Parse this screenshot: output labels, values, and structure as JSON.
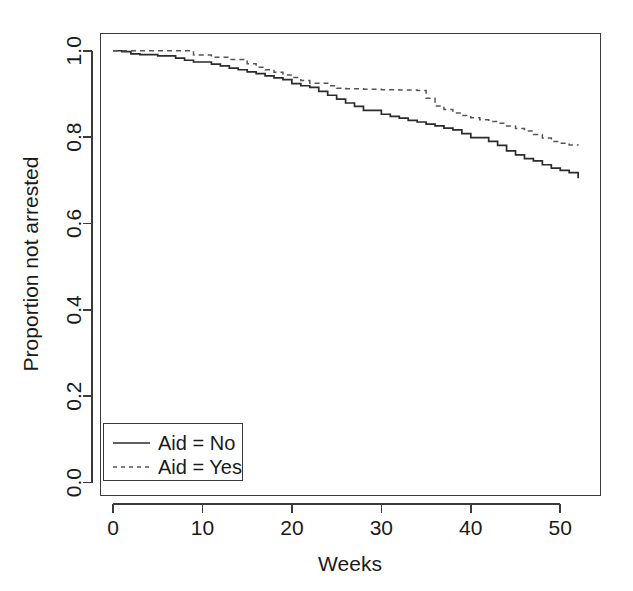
{
  "chart_data": {
    "type": "line",
    "subtype": "kaplan-meier-step",
    "title": "",
    "xlabel": "Weeks",
    "ylabel": "Proportion not arrested",
    "xlim": [
      -1.4,
      54.5
    ],
    "ylim": [
      -0.03,
      1.04
    ],
    "xticks": [
      0,
      10,
      20,
      30,
      40,
      50
    ],
    "xtick_labels": [
      "0",
      "10",
      "20",
      "30",
      "40",
      "50"
    ],
    "yticks": [
      0.0,
      0.2,
      0.4,
      0.6,
      0.8,
      1.0
    ],
    "ytick_labels": [
      "0.0",
      "0.2",
      "0.4",
      "0.6",
      "0.8",
      "1.0"
    ],
    "grid": false,
    "legend_position": "bottom-left",
    "series": [
      {
        "name": "Aid = No",
        "style": "solid",
        "color": "#2b2b2b",
        "x": [
          0,
          1,
          2,
          3,
          5,
          7,
          8,
          9,
          11,
          12,
          13,
          14,
          15,
          16,
          17,
          18,
          19,
          20,
          21,
          22,
          23,
          24,
          25,
          26,
          27,
          28,
          30,
          31,
          32,
          33,
          34,
          35,
          36,
          37,
          38,
          39,
          40,
          42,
          43,
          44,
          45,
          46,
          47,
          48,
          49,
          50,
          51,
          52
        ],
        "y": [
          1.0,
          0.998,
          0.993,
          0.991,
          0.988,
          0.983,
          0.978,
          0.974,
          0.969,
          0.965,
          0.96,
          0.956,
          0.951,
          0.947,
          0.942,
          0.937,
          0.933,
          0.924,
          0.919,
          0.915,
          0.906,
          0.897,
          0.888,
          0.879,
          0.871,
          0.862,
          0.853,
          0.848,
          0.844,
          0.839,
          0.835,
          0.83,
          0.826,
          0.821,
          0.817,
          0.808,
          0.799,
          0.79,
          0.781,
          0.768,
          0.759,
          0.75,
          0.745,
          0.736,
          0.728,
          0.723,
          0.718,
          0.705
        ]
      },
      {
        "name": "Aid = Yes",
        "style": "dotted",
        "color": "#555555",
        "x": [
          0,
          8,
          9,
          11,
          13,
          15,
          16,
          17,
          18,
          19,
          20,
          21,
          22,
          24,
          25,
          26,
          28,
          30,
          32,
          34,
          35,
          36,
          37,
          38,
          39,
          40,
          41,
          42,
          43,
          44,
          45,
          46,
          47,
          48,
          49,
          50,
          51,
          52
        ],
        "y": [
          1.0,
          1.0,
          0.99,
          0.985,
          0.98,
          0.97,
          0.962,
          0.956,
          0.95,
          0.944,
          0.938,
          0.931,
          0.925,
          0.919,
          0.913,
          0.912,
          0.911,
          0.91,
          0.909,
          0.908,
          0.89,
          0.872,
          0.864,
          0.856,
          0.85,
          0.845,
          0.84,
          0.836,
          0.832,
          0.826,
          0.82,
          0.814,
          0.806,
          0.798,
          0.79,
          0.786,
          0.782,
          0.781
        ]
      }
    ],
    "annotations": []
  },
  "axes": {
    "y_axis_label": "Proportion not arrested",
    "x_axis_label": "Weeks",
    "x_tick_labels": [
      "0",
      "10",
      "20",
      "30",
      "40",
      "50"
    ],
    "y_tick_labels": [
      "0.0",
      "0.2",
      "0.4",
      "0.6",
      "0.8",
      "1.0"
    ]
  },
  "legend": {
    "entries": [
      {
        "label": "Aid = No",
        "style": "solid"
      },
      {
        "label": "Aid = Yes",
        "style": "dotted"
      }
    ]
  },
  "colors": {
    "background": "#ffffff",
    "foreground": "#1a1a1a",
    "series_solid": "#2b2b2b",
    "series_dotted": "#555555",
    "axis": "#3a3a3a"
  }
}
